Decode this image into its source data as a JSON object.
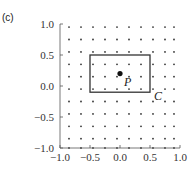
{
  "panel_label": "(c)",
  "chart_data": {
    "type": "scatter",
    "title": "",
    "xlabel": "",
    "ylabel": "",
    "xlim": [
      -1.0,
      1.0
    ],
    "ylim": [
      -1.0,
      1.0
    ],
    "xticks": [
      "-1.0",
      "-0.5",
      "0.0",
      "0.5",
      "1.0"
    ],
    "yticks": [
      "1.0",
      "0.5",
      "0.0",
      "-0.5",
      "-1.0"
    ],
    "grid": false,
    "dot_grid": {
      "x": [
        -0.85,
        -0.65,
        -0.45,
        -0.25,
        -0.05,
        0.15,
        0.35,
        0.55,
        0.75,
        0.9
      ],
      "y": [
        0.95,
        0.75,
        0.55,
        0.35,
        0.15,
        -0.05,
        -0.25,
        -0.45,
        -0.65,
        -0.85,
        -1.0
      ]
    },
    "rectangle": {
      "name": "C",
      "x0": -0.5,
      "x1": 0.5,
      "y0": -0.1,
      "y1": 0.5
    },
    "point": {
      "name": "P",
      "x": 0.0,
      "y": 0.2
    },
    "annotations": [
      "P",
      "C"
    ]
  }
}
